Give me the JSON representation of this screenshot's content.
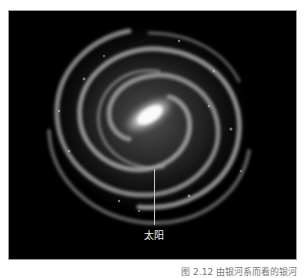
{
  "figure": {
    "background_color": "#000000",
    "marker_line_color": "#c8c8c8",
    "sun_label": "太阳",
    "caption": "图 2.12  由银河系而看的银河"
  }
}
